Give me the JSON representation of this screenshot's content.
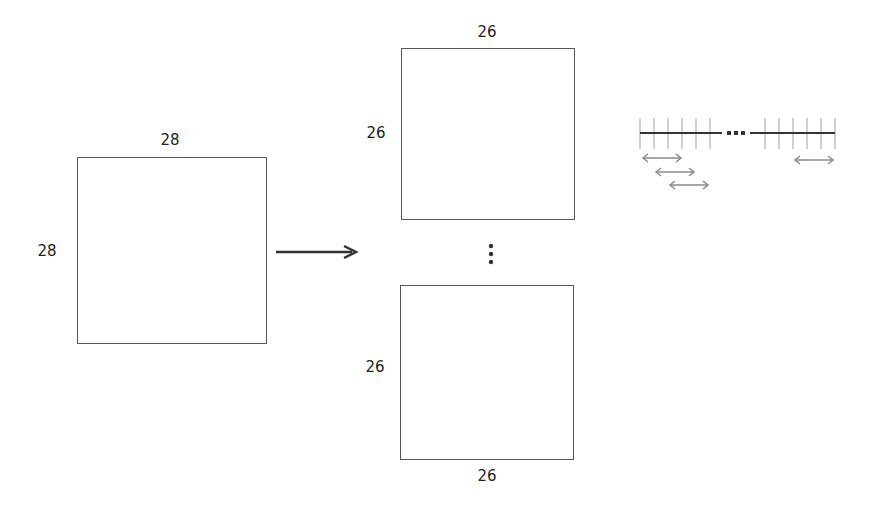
{
  "diagram": {
    "input": {
      "width_label": "28",
      "height_label": "28"
    },
    "outputs": [
      {
        "width_label": "26",
        "height_label": "26",
        "position": "top"
      },
      {
        "width_label": "26",
        "height_label": "26",
        "position": "bottom"
      }
    ],
    "ellipsis": "⋮",
    "sliding_window": {
      "left_ticks": 6,
      "right_ticks": 6,
      "gap": "•••"
    },
    "colors": {
      "stroke": "#555555",
      "arrow": "#333333",
      "window_arrows": "#8a8a8a",
      "ticks": "#9a9a9a"
    }
  }
}
